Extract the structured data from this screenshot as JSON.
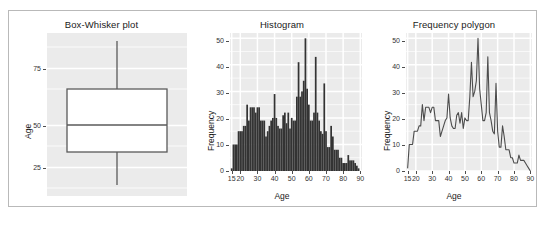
{
  "figure": {
    "background": "#ffffff",
    "panel_fill": "#ebebeb",
    "grid_color": "#ffffff",
    "bar_color": "#333333",
    "line_color": "#4d4d4d",
    "box_fill": "#ffffff",
    "box_stroke": "#5a5a5a",
    "frame_border": "#b9b9b9"
  },
  "panels": [
    {
      "name": "box-whisker",
      "title": "Box-Whisker plot",
      "ylabel": "Age",
      "xlabel": "",
      "yticks": [
        25,
        50,
        75
      ]
    },
    {
      "name": "histogram",
      "title": "Histogram",
      "ylabel": "Frequency",
      "xlabel": "Age",
      "yticks": [
        0,
        10,
        20,
        30,
        40,
        50
      ],
      "xticks": [
        15,
        20,
        30,
        40,
        50,
        60,
        70,
        80,
        90
      ]
    },
    {
      "name": "frequency-polygon",
      "title": "Frequency polygon",
      "ylabel": "Frequency",
      "xlabel": "Age",
      "yticks": [
        0,
        10,
        20,
        30,
        40,
        50
      ],
      "xticks": [
        15,
        20,
        30,
        40,
        50,
        60,
        70,
        80,
        90
      ]
    }
  ],
  "chart_data": [
    {
      "type": "box",
      "title": "Box-Whisker plot",
      "xlabel": "",
      "ylabel": "Age",
      "ylim": [
        13,
        92
      ],
      "yticks": [
        25,
        50,
        75
      ],
      "grid": true,
      "boxes": [
        {
          "label": "Age",
          "whisker_low": 18,
          "q1": 38,
          "median": 51,
          "q3": 62,
          "whisker_high": 88,
          "outliers": []
        }
      ]
    },
    {
      "type": "bar",
      "title": "Histogram",
      "xlabel": "Age",
      "ylabel": "Frequency",
      "xlim": [
        14,
        91
      ],
      "ylim": [
        0,
        52
      ],
      "yticks": [
        0,
        10,
        20,
        30,
        40,
        50
      ],
      "xticks": [
        15,
        20,
        30,
        40,
        50,
        60,
        70,
        80,
        90
      ],
      "grid": true,
      "bin_width": 1,
      "categories": [
        15,
        16,
        17,
        18,
        19,
        20,
        21,
        22,
        23,
        24,
        25,
        26,
        27,
        28,
        29,
        30,
        31,
        32,
        33,
        34,
        35,
        36,
        37,
        38,
        39,
        40,
        41,
        42,
        43,
        44,
        45,
        46,
        47,
        48,
        49,
        50,
        51,
        52,
        53,
        54,
        55,
        56,
        57,
        58,
        59,
        60,
        61,
        62,
        63,
        64,
        65,
        66,
        67,
        68,
        69,
        70,
        71,
        72,
        73,
        74,
        75,
        76,
        77,
        78,
        79,
        80,
        81,
        82,
        83,
        84,
        85,
        86,
        87,
        88,
        89,
        90
      ],
      "values": [
        1,
        10,
        10,
        10,
        15,
        15,
        15,
        17,
        17,
        25,
        19,
        24,
        24,
        24,
        22,
        24,
        24,
        19,
        19,
        19,
        13,
        15,
        17,
        19,
        20,
        29,
        20,
        17,
        16,
        16,
        21,
        22,
        18,
        22,
        16,
        20,
        19,
        19,
        28,
        41,
        28,
        30,
        34,
        50,
        31,
        25,
        19,
        19,
        22,
        43,
        22,
        19,
        15,
        14,
        33,
        15,
        9,
        9,
        17,
        13,
        8,
        8,
        8,
        5,
        5,
        3,
        3,
        3,
        6,
        4,
        4,
        4,
        3,
        2,
        1,
        0
      ]
    },
    {
      "type": "line",
      "title": "Frequency polygon",
      "xlabel": "Age",
      "ylabel": "Frequency",
      "xlim": [
        14,
        91
      ],
      "ylim": [
        0,
        52
      ],
      "yticks": [
        0,
        10,
        20,
        30,
        40,
        50
      ],
      "xticks": [
        15,
        20,
        30,
        40,
        50,
        60,
        70,
        80,
        90
      ],
      "grid": true,
      "x": [
        15,
        16,
        17,
        18,
        19,
        20,
        21,
        22,
        23,
        24,
        25,
        26,
        27,
        28,
        29,
        30,
        31,
        32,
        33,
        34,
        35,
        36,
        37,
        38,
        39,
        40,
        41,
        42,
        43,
        44,
        45,
        46,
        47,
        48,
        49,
        50,
        51,
        52,
        53,
        54,
        55,
        56,
        57,
        58,
        59,
        60,
        61,
        62,
        63,
        64,
        65,
        66,
        67,
        68,
        69,
        70,
        71,
        72,
        73,
        74,
        75,
        76,
        77,
        78,
        79,
        80,
        81,
        82,
        83,
        84,
        85,
        86,
        87,
        88,
        89,
        90
      ],
      "series": [
        {
          "name": "Frequency",
          "values": [
            1,
            10,
            10,
            10,
            15,
            15,
            15,
            17,
            17,
            25,
            19,
            24,
            24,
            24,
            22,
            24,
            24,
            19,
            19,
            19,
            13,
            15,
            17,
            19,
            20,
            29,
            20,
            17,
            16,
            16,
            21,
            22,
            18,
            22,
            16,
            20,
            19,
            19,
            28,
            41,
            28,
            30,
            34,
            50,
            31,
            25,
            19,
            19,
            22,
            43,
            22,
            19,
            15,
            14,
            33,
            15,
            9,
            9,
            17,
            13,
            8,
            8,
            8,
            5,
            5,
            3,
            3,
            3,
            6,
            4,
            4,
            4,
            3,
            2,
            1,
            0
          ]
        }
      ]
    }
  ]
}
